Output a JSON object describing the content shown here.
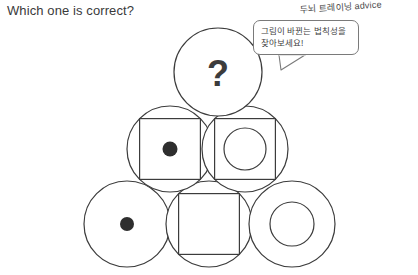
{
  "header": {
    "title": "Which one is correct?"
  },
  "advice": {
    "handwritten_label": "두뇌 트레이닝 advice",
    "bubble_line_1": "그림이 바뀐는 법칙성을",
    "bubble_line_2": "찾아보세요!"
  },
  "puzzle": {
    "missing_marker": "?",
    "stroke_color": "#3c3c3c",
    "fill_color": "#2e2e2e",
    "background_color": "#ffffff",
    "rows": [
      {
        "row_index": 1,
        "cells": [
          {
            "id": "cell-top",
            "label": "unknown-cell",
            "shapes": [
              "circle",
              "question-mark"
            ],
            "cx": 218,
            "cy": 72,
            "r": 44
          }
        ]
      },
      {
        "row_index": 2,
        "cells": [
          {
            "id": "cell-middle-left",
            "label": "circle-square-filled-dot",
            "shapes": [
              "circle",
              "square",
              "filled-dot"
            ],
            "cx": 170,
            "cy": 149,
            "r": 43
          },
          {
            "id": "cell-middle-right",
            "label": "circle-square-hollow-circle",
            "shapes": [
              "circle",
              "square",
              "hollow-circle"
            ],
            "cx": 245,
            "cy": 149,
            "r": 43
          }
        ]
      },
      {
        "row_index": 3,
        "cells": [
          {
            "id": "cell-bottom-left",
            "label": "circle-filled-dot",
            "shapes": [
              "circle",
              "filled-dot"
            ],
            "cx": 127,
            "cy": 224,
            "r": 43
          },
          {
            "id": "cell-bottom-middle",
            "label": "circle-square",
            "shapes": [
              "circle",
              "square"
            ],
            "cx": 209,
            "cy": 224,
            "r": 43
          },
          {
            "id": "cell-bottom-right",
            "label": "circle-hollow-circle",
            "shapes": [
              "circle",
              "hollow-circle"
            ],
            "cx": 292,
            "cy": 224,
            "r": 43
          }
        ]
      }
    ]
  }
}
